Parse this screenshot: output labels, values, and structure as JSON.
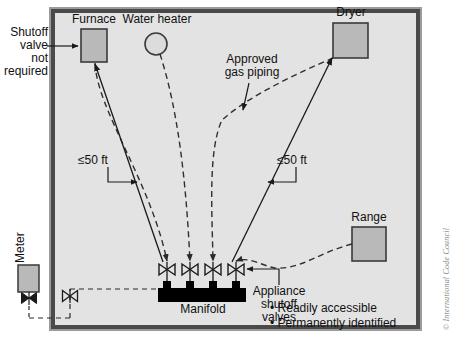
{
  "diagram": {
    "colors": {
      "room_fill": "#e3e3e3",
      "appliance_fill": "#b9b9b9",
      "manifold_fill": "#000000",
      "wall_stroke": "#3a3a3a",
      "line": "#1a1a1a",
      "dashed_pipe": "#444444",
      "copyright_text": "#8a8a8a"
    },
    "callouts": {
      "shutoff_not_required": "Shutoff\nvalve\nnot\nrequired",
      "shutoff_not_required_lines": [
        "Shutoff",
        "valve",
        "not",
        "required"
      ],
      "approved_gas_piping": "Approved\ngas piping",
      "approved_gas_piping_lines": [
        "Approved",
        "gas piping"
      ],
      "appliance_shutoff_valves_lines": [
        "Appliance",
        "shutoff",
        "valves"
      ],
      "distance_left": "≤50 ft",
      "distance_right": "≤50 ft"
    },
    "appliances": [
      {
        "name": "furnace",
        "label": "Furnace",
        "shape": "rect"
      },
      {
        "name": "water-heater",
        "label": "Water heater",
        "shape": "circle"
      },
      {
        "name": "dryer",
        "label": "Dryer",
        "shape": "rect"
      },
      {
        "name": "range",
        "label": "Range",
        "shape": "rect"
      }
    ],
    "manifold": {
      "label": "Manifold",
      "valve_count": 4
    },
    "meter": {
      "label": "Meter"
    },
    "notes": [
      "Readily accessible",
      "Permanently identified"
    ],
    "bullet_glyph": "•",
    "copyright": "© International Code Council"
  }
}
